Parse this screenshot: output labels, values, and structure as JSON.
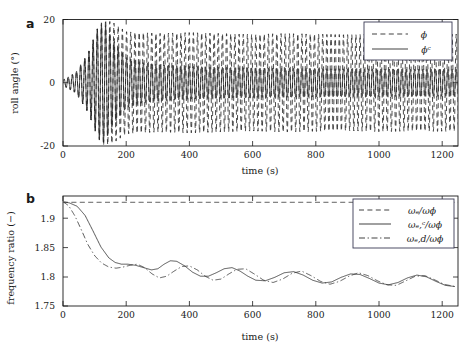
{
  "figure": {
    "width": 470,
    "height": 362,
    "background": "#ffffff",
    "ink_color": "#1a1a1a"
  },
  "panels": [
    {
      "label": "a",
      "ylabel": "roll angle (°)",
      "xlabel": "time (s)",
      "yticks": [
        "-20",
        "0",
        "20"
      ],
      "ytick_values": [
        -20,
        0,
        20
      ],
      "xticks": [
        "0",
        "200",
        "400",
        "600",
        "800",
        "1000",
        "1200"
      ],
      "xtick_values": [
        0,
        200,
        400,
        600,
        800,
        1000,
        1200
      ],
      "xlim": [
        0,
        1250
      ],
      "ylim": [
        -20,
        20
      ],
      "legend": [
        {
          "label": "ϕ",
          "style": "dashed"
        },
        {
          "label": "ϕᶜ",
          "style": "solid"
        }
      ]
    },
    {
      "label": "b",
      "ylabel": "frequency ratio (−)",
      "xlabel": "time (s)",
      "yticks": [
        "1.75",
        "1.8",
        "1.85",
        "1.9"
      ],
      "ytick_values": [
        1.75,
        1.8,
        1.85,
        1.9
      ],
      "xticks": [
        "0",
        "200",
        "400",
        "600",
        "800",
        "1000",
        "1200"
      ],
      "xtick_values": [
        0,
        200,
        400,
        600,
        800,
        1000,
        1200
      ],
      "xlim": [
        0,
        1250
      ],
      "ylim": [
        1.745,
        1.937
      ],
      "legend": [
        {
          "label": "ωₑ/ωϕ",
          "style": "dashed"
        },
        {
          "label": "ωₑ,ᶜ/ωϕ",
          "style": "solid"
        },
        {
          "label": "ωₑ,d/ωϕ",
          "style": "dashdot"
        }
      ]
    }
  ],
  "chart_data": [
    {
      "type": "line",
      "panel": "a",
      "title": "",
      "xlabel": "time (s)",
      "ylabel": "roll angle (°)",
      "xlim": [
        0,
        1250
      ],
      "ylim": [
        -20,
        20
      ],
      "xticks": [
        0,
        200,
        400,
        600,
        800,
        1000,
        1200
      ],
      "yticks": [
        -20,
        0,
        20
      ],
      "grid": false,
      "legend_position": "upper right",
      "description": "Two oscillatory roll-angle time histories. Both start near zero and grow; the dashed signal phi saturates at a large amplitude near 15-17 degrees while the solid signal phi_c settles to a much smaller amplitude near 4-5 degrees.",
      "series": [
        {
          "name": "ϕ",
          "style": "dashed",
          "oscillation_period_s": 13.2,
          "envelope_x": [
            0,
            40,
            80,
            110,
            130,
            160,
            200,
            300,
            400,
            500,
            600,
            700,
            800,
            900,
            1000,
            1100,
            1200,
            1250
          ],
          "envelope_amplitude_deg": [
            0.9,
            3.2,
            9.5,
            17.5,
            20.0,
            19.0,
            16.2,
            15.6,
            15.9,
            15.6,
            15.3,
            15.6,
            15.4,
            15.2,
            15.5,
            15.3,
            15.4,
            15.4
          ]
        },
        {
          "name": "ϕᶜ",
          "style": "solid",
          "oscillation_period_s": 13.2,
          "envelope_x": [
            0,
            40,
            80,
            110,
            130,
            160,
            200,
            250,
            300,
            400,
            500,
            600,
            700,
            800,
            900,
            1000,
            1100,
            1200,
            1250
          ],
          "envelope_amplitude_deg": [
            0.9,
            3.2,
            9.5,
            17.5,
            19.0,
            13.0,
            8.0,
            6.4,
            5.8,
            5.2,
            4.9,
            4.7,
            4.6,
            4.5,
            4.4,
            4.4,
            4.3,
            4.3,
            4.3
          ]
        }
      ]
    },
    {
      "type": "line",
      "panel": "b",
      "title": "",
      "xlabel": "time (s)",
      "ylabel": "frequency ratio (−)",
      "xlim": [
        0,
        1250
      ],
      "ylim": [
        1.745,
        1.937
      ],
      "xticks": [
        0,
        200,
        400,
        600,
        800,
        1000,
        1200
      ],
      "yticks": [
        1.75,
        1.8,
        1.85,
        1.9
      ],
      "grid": false,
      "legend_position": "upper right",
      "description": "Dashed reference stays constant at about 1.926. Solid and dash-dot curves start near 1.926, decay steeply to about 1.825 by t=150 s, then oscillate with slowly decaying amplitude about a mean drifting from 1.815 down to 1.785.",
      "series": [
        {
          "name": "ωₑ/ωϕ",
          "style": "dashed",
          "x": [
            0,
            1250
          ],
          "values": [
            1.926,
            1.926
          ]
        },
        {
          "name": "ωₑ,ᶜ/ωϕ",
          "style": "solid",
          "x": [
            0,
            20,
            45,
            70,
            95,
            120,
            145,
            165,
            185,
            205,
            230,
            255,
            280,
            300,
            320,
            340,
            360,
            385,
            410,
            435,
            460,
            485,
            510,
            535,
            560,
            585,
            610,
            640,
            670,
            700,
            730,
            760,
            790,
            820,
            850,
            880,
            910,
            940,
            970,
            1000,
            1030,
            1060,
            1090,
            1120,
            1150,
            1180,
            1210,
            1240
          ],
          "values": [
            1.927,
            1.925,
            1.919,
            1.903,
            1.876,
            1.848,
            1.829,
            1.821,
            1.818,
            1.818,
            1.816,
            1.812,
            1.808,
            1.81,
            1.818,
            1.824,
            1.823,
            1.815,
            1.804,
            1.797,
            1.797,
            1.803,
            1.81,
            1.812,
            1.806,
            1.797,
            1.79,
            1.789,
            1.795,
            1.803,
            1.805,
            1.799,
            1.79,
            1.785,
            1.787,
            1.795,
            1.801,
            1.8,
            1.793,
            1.785,
            1.782,
            1.786,
            1.794,
            1.799,
            1.796,
            1.788,
            1.781,
            1.779
          ]
        },
        {
          "name": "ωₑ,d/ωϕ",
          "style": "dashdot",
          "x": [
            0,
            18,
            38,
            58,
            78,
            100,
            122,
            145,
            168,
            190,
            212,
            235,
            258,
            282,
            305,
            328,
            352,
            376,
            400,
            425,
            450,
            475,
            500,
            525,
            550,
            578,
            605,
            635,
            665,
            695,
            725,
            755,
            785,
            815,
            845,
            875,
            905,
            935,
            965,
            995,
            1025,
            1055,
            1085,
            1115,
            1145,
            1175,
            1205,
            1240
          ],
          "values": [
            1.927,
            1.92,
            1.902,
            1.878,
            1.853,
            1.833,
            1.82,
            1.813,
            1.811,
            1.813,
            1.816,
            1.818,
            1.812,
            1.801,
            1.794,
            1.797,
            1.806,
            1.814,
            1.815,
            1.808,
            1.797,
            1.79,
            1.792,
            1.801,
            1.809,
            1.81,
            1.801,
            1.79,
            1.786,
            1.792,
            1.802,
            1.806,
            1.798,
            1.788,
            1.783,
            1.788,
            1.797,
            1.803,
            1.798,
            1.789,
            1.782,
            1.781,
            1.789,
            1.797,
            1.798,
            1.791,
            1.783,
            1.779
          ]
        }
      ]
    }
  ]
}
